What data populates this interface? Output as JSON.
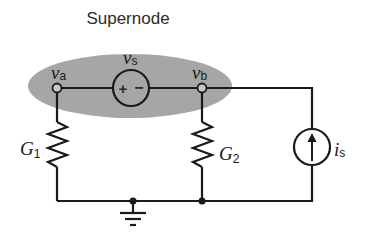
{
  "title": "Supernode",
  "nodes": {
    "a": {
      "symbol": "v",
      "subscript": "a"
    },
    "b": {
      "symbol": "v",
      "subscript": "b"
    }
  },
  "voltage_source": {
    "symbol": "v",
    "subscript": "s",
    "plus": "+",
    "minus": "−"
  },
  "resistors": [
    {
      "symbol": "G",
      "subscript": "1"
    },
    {
      "symbol": "G",
      "subscript": "2"
    }
  ],
  "current_source": {
    "symbol": "i",
    "subscript": "s",
    "direction": "up"
  },
  "colors": {
    "supernode_fill": "#a6a6a6",
    "wire": "#1a1a1a",
    "background": "#ffffff"
  }
}
